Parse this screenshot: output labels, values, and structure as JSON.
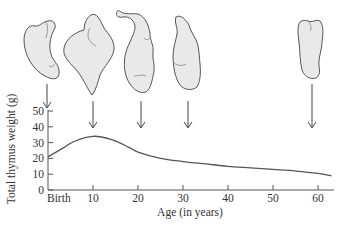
{
  "chart_data": {
    "type": "line",
    "title": "",
    "xlabel": "Age (in years)",
    "ylabel": "Total thymus weight (g)",
    "x_tick_labels": [
      "Birth",
      "10",
      "20",
      "30",
      "40",
      "50",
      "60"
    ],
    "x_ticks": [
      0,
      10,
      20,
      30,
      40,
      50,
      60
    ],
    "y_tick_labels": [
      "0",
      "10",
      "20",
      "30",
      "40",
      "50"
    ],
    "y_ticks": [
      0,
      10,
      20,
      30,
      40,
      50
    ],
    "xlim": [
      0,
      63
    ],
    "ylim": [
      0,
      50
    ],
    "grid": false,
    "legend": null,
    "series": [
      {
        "name": "Total thymus weight",
        "x": [
          0,
          3,
          6,
          10,
          14,
          18,
          20,
          25,
          30,
          35,
          40,
          45,
          50,
          55,
          60,
          63
        ],
        "values": [
          21,
          26,
          31,
          34,
          32,
          27,
          24,
          20,
          18,
          16.5,
          15,
          14,
          13,
          12,
          10.5,
          9
        ]
      }
    ],
    "annotations": [
      {
        "type": "thymus-illustration",
        "age": 0,
        "label": "Birth"
      },
      {
        "type": "thymus-illustration",
        "age": 10
      },
      {
        "type": "thymus-illustration",
        "age": 21
      },
      {
        "type": "thymus-illustration",
        "age": 31
      },
      {
        "type": "thymus-illustration",
        "age": 59
      }
    ]
  }
}
